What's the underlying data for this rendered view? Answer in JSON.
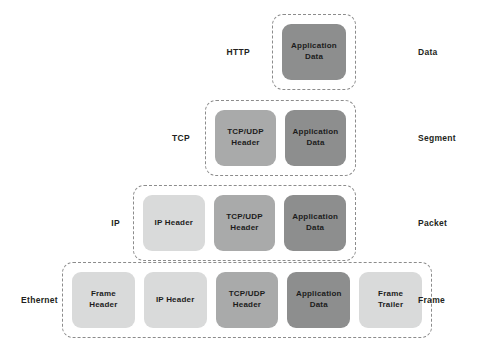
{
  "diagram": {
    "background": "#ffffff",
    "colors": {
      "light": "#d9dada",
      "mid": "#a9aaaa",
      "dark": "#8d8e8e",
      "dash_border": "#8c8c8c",
      "text": "#231f20"
    }
  },
  "rows": [
    {
      "protocol": "HTTP",
      "unit": "Data",
      "blocks": [
        {
          "label": "Application\nData",
          "shade": "dark"
        }
      ]
    },
    {
      "protocol": "TCP",
      "unit": "Segment",
      "blocks": [
        {
          "label": "TCP/UDP\nHeader",
          "shade": "mid"
        },
        {
          "label": "Application\nData",
          "shade": "dark"
        }
      ]
    },
    {
      "protocol": "IP",
      "unit": "Packet",
      "blocks": [
        {
          "label": "IP Header",
          "shade": "light"
        },
        {
          "label": "TCP/UDP\nHeader",
          "shade": "mid"
        },
        {
          "label": "Application\nData",
          "shade": "dark"
        }
      ]
    },
    {
      "protocol": "Ethernet",
      "unit": "Frame",
      "blocks": [
        {
          "label": "Frame\nHeader",
          "shade": "light"
        },
        {
          "label": "IP Header",
          "shade": "light"
        },
        {
          "label": "TCP/UDP\nHeader",
          "shade": "mid"
        },
        {
          "label": "Application\nData",
          "shade": "dark"
        },
        {
          "label": "Frame\nTrailer",
          "shade": "light"
        }
      ]
    }
  ]
}
